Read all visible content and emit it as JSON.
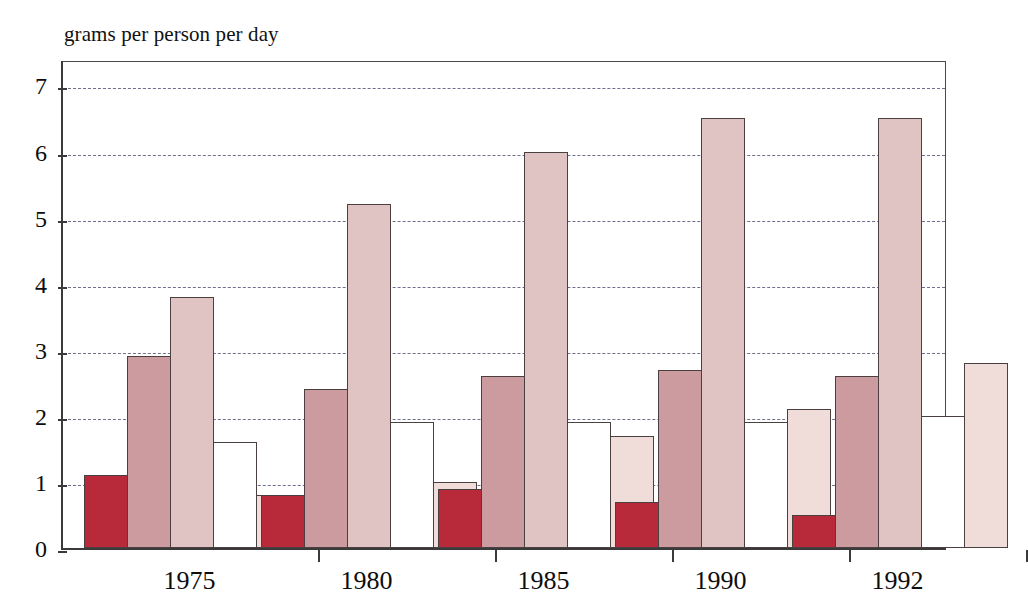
{
  "chart_data": {
    "type": "bar",
    "title": "grams per person per day",
    "xlabel": "",
    "ylabel": "grams per person per day",
    "categories": [
      "1975",
      "1980",
      "1985",
      "1990",
      "1992"
    ],
    "ylim": [
      0,
      7.4
    ],
    "yticks": [
      0,
      1,
      2,
      3,
      4,
      5,
      6,
      7
    ],
    "ytick_labels": [
      "0",
      "1",
      "2",
      "3",
      "4",
      "5",
      "6",
      "7"
    ],
    "grid": true,
    "gridlines_at": [
      1,
      2,
      3,
      4,
      5,
      6,
      7
    ],
    "legend": null,
    "legend_position": "none",
    "series": [
      {
        "name": "series-1",
        "color": "#b8293a",
        "values": [
          1.1,
          0.8,
          0.9,
          0.7,
          0.5
        ]
      },
      {
        "name": "series-2",
        "color": "#cc9ba0",
        "values": [
          2.9,
          2.4,
          2.6,
          2.7,
          2.6
        ]
      },
      {
        "name": "series-3",
        "color": "#e0c3c3",
        "values": [
          3.8,
          5.2,
          6.0,
          6.5,
          6.5
        ]
      },
      {
        "name": "series-4",
        "color": "#ffffff",
        "values": [
          1.6,
          1.9,
          1.9,
          1.9,
          2.0
        ]
      },
      {
        "name": "series-5",
        "color": "#f0dcd8",
        "values": [
          0.8,
          1.0,
          1.7,
          2.1,
          2.8
        ]
      }
    ]
  },
  "axis_colors": {
    "axis_line": "#3a3a3a",
    "gridline": "#55557a",
    "bar_outline": "#4b4040",
    "background": "#ffffff"
  }
}
